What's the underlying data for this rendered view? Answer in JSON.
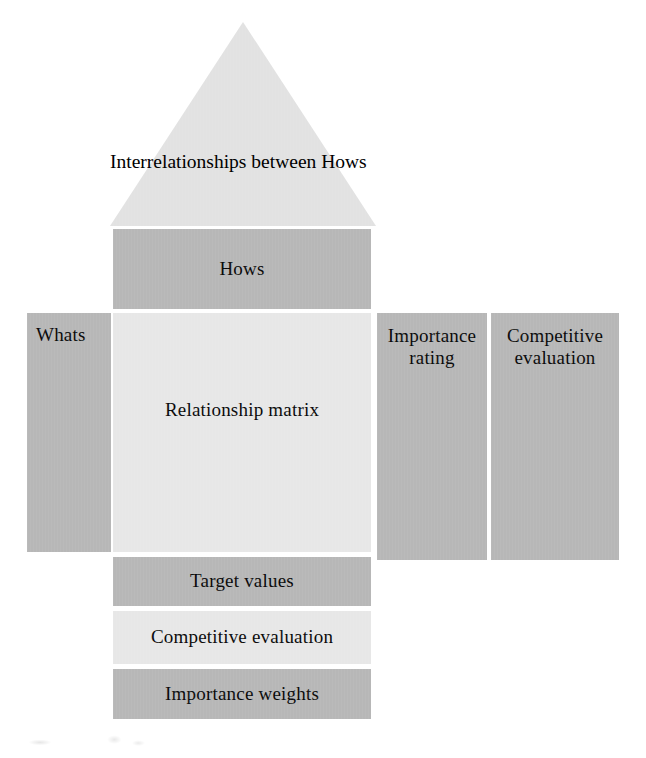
{
  "diagram": {
    "type": "house-of-quality",
    "canvas": {
      "width": 646,
      "height": 758,
      "background": "#ffffff"
    },
    "palette": {
      "mid_gray": "#b7b7b7",
      "light_gray": "#e7e7e7",
      "roof_gray": "#e2e2e2",
      "text": "#0a0a0a",
      "background": "#ffffff"
    },
    "rooms": {
      "roof": {
        "label": "Interrelationships\nbetween Hows",
        "shape": "triangle",
        "fill": "#e2e2e2"
      },
      "hows": {
        "label": "Hows",
        "shape": "rectangle",
        "fill": "#b7b7b7"
      },
      "whats": {
        "label": "Whats",
        "shape": "rectangle",
        "fill": "#b7b7b7"
      },
      "relationship_matrix": {
        "label": "Relationship matrix",
        "shape": "rectangle",
        "fill": "#e7e7e7"
      },
      "importance_rating": {
        "label": "Importance\nrating",
        "shape": "rectangle",
        "fill": "#b7b7b7"
      },
      "competitive_evaluation_right": {
        "label": "Competitive\nevaluation",
        "shape": "rectangle",
        "fill": "#b7b7b7"
      },
      "target_values": {
        "label": "Target values",
        "shape": "rectangle",
        "fill": "#b7b7b7"
      },
      "competitive_evaluation_bottom": {
        "label": "Competitive evaluation",
        "shape": "rectangle",
        "fill": "#e7e7e7"
      },
      "importance_weights": {
        "label": "Importance weights",
        "shape": "rectangle",
        "fill": "#b7b7b7"
      }
    }
  }
}
